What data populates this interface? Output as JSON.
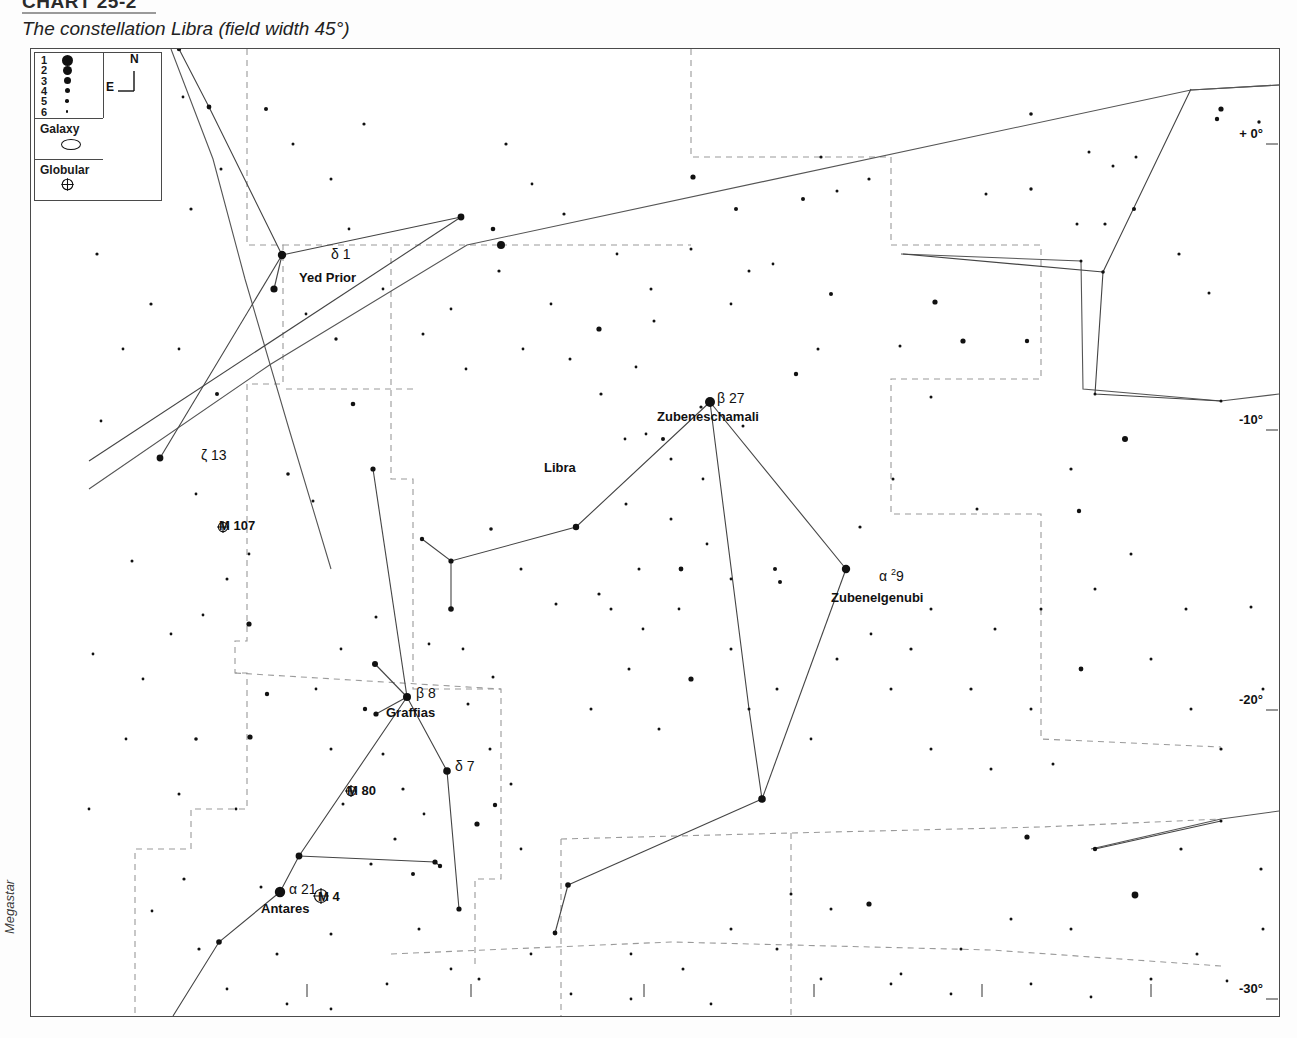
{
  "header": {
    "chart_number": "CHART 25-2",
    "rule": true,
    "caption": "The constellation Libra (field width 45°)"
  },
  "credit": "Megastar",
  "legend": {
    "magnitudes": [
      {
        "label": "1",
        "size": 11
      },
      {
        "label": "2",
        "size": 9
      },
      {
        "label": "3",
        "size": 7
      },
      {
        "label": "4",
        "size": 5
      },
      {
        "label": "5",
        "size": 3.5
      },
      {
        "label": "6",
        "size": 2.4
      }
    ],
    "compass": {
      "north": "N",
      "east": "E"
    },
    "galaxy_label": "Galaxy",
    "globular_label": "Globular"
  },
  "constellation_label": "Libra",
  "neighbour_label": "Scorpius",
  "star_labels": [
    {
      "greek": "δ 1",
      "name": "Yed Prior",
      "gx": 300,
      "gy": 198,
      "nx": 268,
      "ny": 222
    },
    {
      "greek": "ζ 13",
      "name": "",
      "gx": 170,
      "gy": 399,
      "nx": 0,
      "ny": 0
    },
    {
      "greek": "β 27",
      "name": "Zubeneschamali",
      "gx": 686,
      "gy": 342,
      "nx": 626,
      "ny": 361
    },
    {
      "greek": "α ²9",
      "name": "Zubenelgenubi",
      "gx": 848,
      "gy": 519,
      "nx": 800,
      "ny": 542
    },
    {
      "greek": "β 8",
      "name": "Graffias",
      "gx": 385,
      "gy": 637,
      "nx": 355,
      "ny": 657
    },
    {
      "greek": "δ 7",
      "name": "",
      "gx": 424,
      "gy": 710,
      "nx": 0,
      "ny": 0
    },
    {
      "greek": "α 21",
      "name": "Antares",
      "gx": 258,
      "gy": 833,
      "nx": 230,
      "ny": 853
    }
  ],
  "deep_sky": [
    {
      "label": "M 107",
      "x": 188,
      "y": 470,
      "type": "globular"
    },
    {
      "label": "M 80",
      "x": 316,
      "y": 735,
      "type": "globular"
    },
    {
      "label": "M 4",
      "x": 287,
      "y": 841,
      "type": "globular"
    }
  ],
  "axes": {
    "ra_label_suffix": "",
    "right_ascension": [
      {
        "label": "16h 30m",
        "x": 276
      },
      {
        "label": "16h 00m",
        "x": 440
      },
      {
        "label": "15h 30m",
        "x": 613
      },
      {
        "label": "15h 00m",
        "x": 783
      },
      {
        "label": "14h 30m",
        "x": 951
      },
      {
        "label": "14h 00m",
        "x": 1120
      }
    ],
    "declination": [
      {
        "label": "+ 0°",
        "y": 95
      },
      {
        "label": "-10°",
        "y": 381
      },
      {
        "label": "-20°",
        "y": 661
      },
      {
        "label": "-30°",
        "y": 950
      }
    ]
  },
  "chart_data": {
    "type": "scatter",
    "title": "The constellation Libra (field width 45°)",
    "xlabel": "Right Ascension",
    "ylabel": "Declination",
    "xlim": [
      "16h 45m",
      "13h 50m"
    ],
    "ylim": [
      2,
      -32
    ],
    "grid": "dashed constellation boundaries",
    "named_stars": [
      {
        "name": "Yed Prior",
        "bayer": "δ 1",
        "px": 281,
        "py": 202,
        "mag": 2
      },
      {
        "name": "ζ 13",
        "bayer": "ζ 13",
        "px": 159,
        "py": 406,
        "mag": 3
      },
      {
        "name": "Zubeneschamali",
        "bayer": "β 27",
        "px": 679,
        "py": 353,
        "mag": 2
      },
      {
        "name": "Zubenelgenubi",
        "bayer": "α ²9",
        "px": 844,
        "py": 530,
        "mag": 2
      },
      {
        "name": "Graffias",
        "bayer": "β 8",
        "px": 376,
        "py": 648,
        "mag": 2
      },
      {
        "name": "δ 7",
        "bayer": "δ 7",
        "px": 416,
        "py": 722,
        "mag": 2
      },
      {
        "name": "Antares",
        "bayer": "α 21",
        "px": 249,
        "py": 843,
        "mag": 1
      }
    ],
    "globular_clusters": [
      {
        "name": "M 107",
        "px": 192,
        "py": 478
      },
      {
        "name": "M 80",
        "px": 320,
        "py": 742
      },
      {
        "name": "M 4",
        "px": 290,
        "py": 847
      }
    ],
    "magnitude_scale": [
      1,
      2,
      3,
      4,
      5,
      6
    ]
  }
}
